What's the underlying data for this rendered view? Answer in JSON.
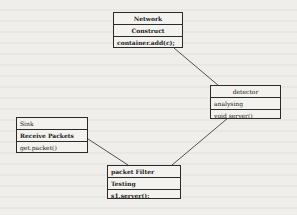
{
  "diagram": {
    "type": "uml-class-diagram",
    "classes": [
      {
        "id": "network",
        "name": "Network",
        "attribute": "Construct",
        "method": "container.add(c);"
      },
      {
        "id": "detector",
        "name": "detector",
        "attribute": "analysing",
        "method": "void server()"
      },
      {
        "id": "sink",
        "name": "Sink",
        "attribute": "Receive Packets",
        "method": "get.packet()"
      },
      {
        "id": "packet-filter",
        "name": "packet Filter",
        "attribute": "Testing",
        "method": "s1.server();"
      }
    ],
    "links": [
      {
        "from": "network",
        "to": "detector"
      },
      {
        "from": "detector",
        "to": "packet-filter"
      },
      {
        "from": "sink",
        "to": "packet-filter"
      }
    ],
    "colors": {
      "line": "#2a2a2a",
      "background": "#f0eeeb"
    }
  }
}
